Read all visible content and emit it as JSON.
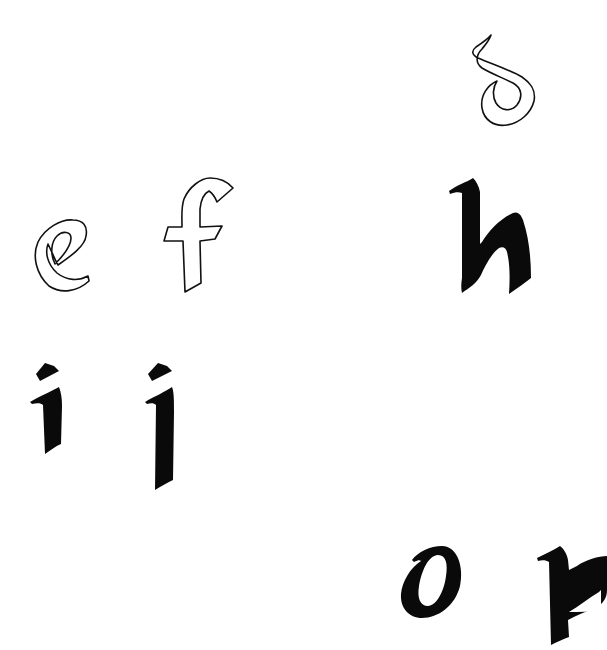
{
  "sheet": {
    "title": "",
    "background": "#ffffff",
    "ink_color": "#0a0a0a",
    "glyphs": [
      {
        "char": "d",
        "style": "outline",
        "x": 470,
        "y": 33,
        "w": 75,
        "h": 95
      },
      {
        "char": "e",
        "style": "outline",
        "x": 33,
        "y": 218,
        "w": 60,
        "h": 75
      },
      {
        "char": "f",
        "style": "outline",
        "x": 163,
        "y": 177,
        "w": 73,
        "h": 116
      },
      {
        "char": "h",
        "style": "solid",
        "x": 449,
        "y": 178,
        "w": 84,
        "h": 117
      },
      {
        "char": "i",
        "style": "solid",
        "x": 30,
        "y": 362,
        "w": 36,
        "h": 93
      },
      {
        "char": "j",
        "style": "solid",
        "x": 145,
        "y": 362,
        "w": 34,
        "h": 129
      },
      {
        "char": "o",
        "style": "solid",
        "x": 400,
        "y": 546,
        "w": 63,
        "h": 73
      },
      {
        "char": "p",
        "style": "solid",
        "x": 537,
        "y": 546,
        "w": 70,
        "h": 100
      }
    ]
  }
}
